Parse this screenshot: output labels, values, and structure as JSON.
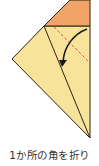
{
  "caption": "1か所の角を折り",
  "colors": {
    "paper_front": "#f8e39a",
    "paper_back": "#f0a468",
    "outline": "#2a2418",
    "fold_line": "#e0506a",
    "arrow": "#1a1a1a"
  }
}
